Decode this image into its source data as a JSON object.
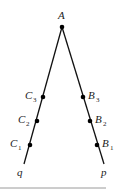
{
  "diagram": {
    "vertex": {
      "label": "A",
      "x": 62,
      "y": 27
    },
    "rays": [
      {
        "name": "q",
        "end": {
          "x": 24,
          "y": 164
        }
      },
      {
        "name": "p",
        "end": {
          "x": 104,
          "y": 164
        }
      }
    ],
    "points_left": [
      {
        "base": "C",
        "sub": "3",
        "x": 43,
        "y": 97
      },
      {
        "base": "C",
        "sub": "2",
        "x": 37,
        "y": 121
      },
      {
        "base": "C",
        "sub": "1",
        "x": 30,
        "y": 145
      }
    ],
    "points_right": [
      {
        "base": "B",
        "sub": "3",
        "x": 83,
        "y": 97
      },
      {
        "base": "B",
        "sub": "2",
        "x": 90,
        "y": 121
      },
      {
        "base": "B",
        "sub": "1",
        "x": 97,
        "y": 145
      }
    ],
    "labels": {
      "A": "A",
      "q": "q",
      "p": "p",
      "C": "C",
      "B": "B",
      "s1": "1",
      "s2": "2",
      "s3": "3"
    },
    "colors": {
      "line": "#111111",
      "point": "#000000",
      "rule": "#9a9a9a"
    }
  }
}
